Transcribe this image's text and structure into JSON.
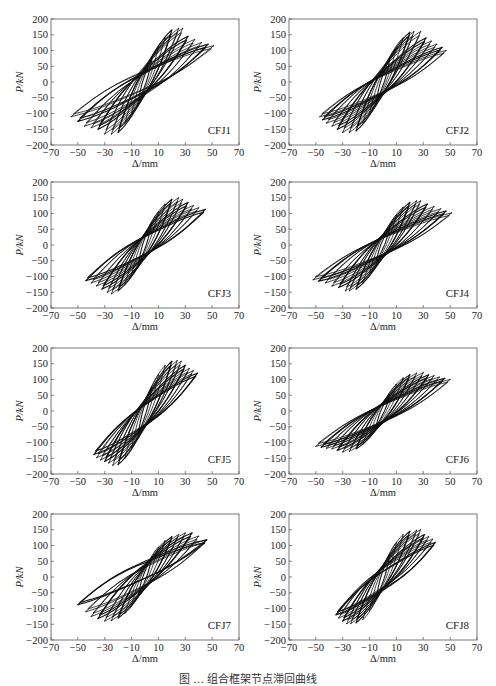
{
  "figure": {
    "caption": "图 … 组合框架节点滞回曲线"
  },
  "chart_data": [
    {
      "type": "line",
      "title": "CFJ1",
      "label": "CFJ1",
      "xlabel": "Δ/mm",
      "ylabel": "P/kN",
      "xlim": [
        -70,
        70
      ],
      "ylim": [
        -200,
        200
      ],
      "xticks": [
        -70,
        -50,
        -30,
        -10,
        10,
        30,
        50,
        70
      ],
      "yticks": [
        -200,
        -150,
        -100,
        -50,
        0,
        50,
        100,
        150,
        200
      ],
      "grid": false,
      "legend": "none",
      "label_position": "bottom-right",
      "envelope": {
        "pos": {
          "x": [
            5,
            10,
            15,
            20,
            25,
            28,
            32,
            37,
            42,
            47,
            51
          ],
          "y": [
            70,
            110,
            140,
            165,
            170,
            170,
            145,
            135,
            125,
            120,
            115
          ]
        },
        "neg": {
          "x": [
            -5,
            -10,
            -15,
            -20,
            -25,
            -30,
            -35,
            -40,
            -45,
            -50,
            -55
          ],
          "y": [
            -60,
            -100,
            -130,
            -160,
            -165,
            -165,
            -150,
            -145,
            -140,
            -125,
            -110
          ]
        }
      }
    },
    {
      "type": "line",
      "title": "CFJ2",
      "label": "CFJ2",
      "xlabel": "Δ/mm",
      "ylabel": "P/kN",
      "xlim": [
        -70,
        70
      ],
      "ylim": [
        -200,
        200
      ],
      "xticks": [
        -70,
        -50,
        -30,
        -10,
        10,
        30,
        50,
        70
      ],
      "yticks": [
        -200,
        -150,
        -100,
        -50,
        0,
        50,
        100,
        150,
        200
      ],
      "grid": false,
      "legend": "none",
      "label_position": "bottom-right",
      "envelope": {
        "pos": {
          "x": [
            5,
            10,
            15,
            20,
            23,
            28,
            32,
            36,
            40,
            44,
            47
          ],
          "y": [
            70,
            110,
            140,
            158,
            160,
            160,
            140,
            130,
            120,
            110,
            100
          ]
        },
        "neg": {
          "x": [
            -5,
            -10,
            -15,
            -20,
            -25,
            -30,
            -34,
            -38,
            -42,
            -45,
            -47
          ],
          "y": [
            -60,
            -100,
            -130,
            -155,
            -160,
            -160,
            -150,
            -140,
            -130,
            -120,
            -110
          ]
        }
      }
    },
    {
      "type": "line",
      "title": "CFJ3",
      "label": "CFJ3",
      "xlabel": "Δ/mm",
      "ylabel": "P/kN",
      "xlim": [
        -70,
        70
      ],
      "ylim": [
        -200,
        200
      ],
      "xticks": [
        -70,
        -50,
        -30,
        -10,
        10,
        30,
        50,
        70
      ],
      "yticks": [
        -200,
        -150,
        -100,
        -50,
        0,
        50,
        100,
        150,
        200
      ],
      "grid": false,
      "legend": "none",
      "label_position": "bottom-right",
      "envelope": {
        "pos": {
          "x": [
            5,
            10,
            15,
            20,
            25,
            28,
            32,
            36,
            40,
            45
          ],
          "y": [
            70,
            105,
            130,
            145,
            150,
            145,
            135,
            125,
            118,
            113
          ]
        },
        "neg": {
          "x": [
            -5,
            -10,
            -15,
            -20,
            -25,
            -28,
            -32,
            -36,
            -40,
            -44
          ],
          "y": [
            -60,
            -95,
            -125,
            -145,
            -155,
            -150,
            -140,
            -130,
            -120,
            -113
          ]
        }
      }
    },
    {
      "type": "line",
      "title": "CFJ4",
      "label": "CFJ4",
      "xlabel": "Δ/mm",
      "ylabel": "P/kN",
      "xlim": [
        -70,
        70
      ],
      "ylim": [
        -200,
        200
      ],
      "xticks": [
        -70,
        -50,
        -30,
        -10,
        10,
        30,
        50,
        70
      ],
      "yticks": [
        -200,
        -150,
        -100,
        -50,
        0,
        50,
        100,
        150,
        200
      ],
      "grid": false,
      "legend": "none",
      "label_position": "bottom-right",
      "envelope": {
        "pos": {
          "x": [
            5,
            10,
            15,
            20,
            25,
            28,
            33,
            38,
            43,
            47,
            51
          ],
          "y": [
            55,
            95,
            120,
            135,
            140,
            140,
            130,
            122,
            115,
            108,
            102
          ]
        },
        "neg": {
          "x": [
            -5,
            -10,
            -15,
            -20,
            -25,
            -28,
            -33,
            -38,
            -43,
            -48,
            -52
          ],
          "y": [
            -50,
            -90,
            -120,
            -140,
            -145,
            -145,
            -135,
            -130,
            -120,
            -115,
            -110
          ]
        }
      }
    },
    {
      "type": "line",
      "title": "CFJ5",
      "label": "CFJ5",
      "xlabel": "Δ/mm",
      "ylabel": "P/kN",
      "xlim": [
        -70,
        70
      ],
      "ylim": [
        -200,
        200
      ],
      "xticks": [
        -70,
        -50,
        -30,
        -10,
        10,
        30,
        50,
        70
      ],
      "yticks": [
        -200,
        -150,
        -100,
        -50,
        0,
        50,
        100,
        150,
        200
      ],
      "grid": false,
      "legend": "none",
      "label_position": "bottom-right",
      "envelope": {
        "pos": {
          "x": [
            5,
            10,
            15,
            20,
            24,
            27,
            30,
            33,
            36,
            39
          ],
          "y": [
            75,
            115,
            145,
            158,
            160,
            158,
            145,
            135,
            128,
            120
          ]
        },
        "neg": {
          "x": [
            -5,
            -10,
            -15,
            -20,
            -24,
            -27,
            -30,
            -33,
            -36,
            -38
          ],
          "y": [
            -70,
            -115,
            -150,
            -170,
            -172,
            -165,
            -160,
            -155,
            -148,
            -138
          ]
        }
      }
    },
    {
      "type": "line",
      "title": "CFJ6",
      "label": "CFJ6",
      "xlabel": "Δ/mm",
      "ylabel": "P/kN",
      "xlim": [
        -70,
        70
      ],
      "ylim": [
        -200,
        200
      ],
      "xticks": [
        -70,
        -50,
        -30,
        -10,
        10,
        30,
        50,
        70
      ],
      "yticks": [
        -200,
        -150,
        -100,
        -50,
        0,
        50,
        100,
        150,
        200
      ],
      "grid": false,
      "legend": "none",
      "label_position": "bottom-right",
      "envelope": {
        "pos": {
          "x": [
            5,
            10,
            15,
            20,
            25,
            30,
            34,
            38,
            42,
            46,
            50
          ],
          "y": [
            50,
            85,
            105,
            115,
            120,
            122,
            115,
            112,
            108,
            104,
            100
          ]
        },
        "neg": {
          "x": [
            -5,
            -10,
            -15,
            -20,
            -25,
            -30,
            -34,
            -38,
            -42,
            -46,
            -50
          ],
          "y": [
            -45,
            -80,
            -105,
            -120,
            -128,
            -130,
            -125,
            -120,
            -118,
            -115,
            -112
          ]
        }
      }
    },
    {
      "type": "line",
      "title": "CFJ7",
      "label": "CFJ7",
      "xlabel": "Δ/mm",
      "ylabel": "P/kN",
      "xlim": [
        -70,
        70
      ],
      "ylim": [
        -200,
        200
      ],
      "xticks": [
        -70,
        -50,
        -30,
        -10,
        10,
        30,
        50,
        70
      ],
      "yticks": [
        -200,
        -150,
        -100,
        -50,
        0,
        50,
        100,
        150,
        200
      ],
      "grid": false,
      "legend": "none",
      "label_position": "bottom-right",
      "envelope": {
        "pos": {
          "x": [
            5,
            10,
            15,
            20,
            25,
            30,
            35,
            40,
            46
          ],
          "y": [
            60,
            95,
            115,
            128,
            135,
            140,
            140,
            130,
            118
          ]
        },
        "neg": {
          "x": [
            -5,
            -10,
            -15,
            -20,
            -25,
            -30,
            -35,
            -40,
            -44,
            -50
          ],
          "y": [
            -55,
            -90,
            -115,
            -130,
            -138,
            -140,
            -132,
            -125,
            -110,
            -88
          ]
        }
      }
    },
    {
      "type": "line",
      "title": "CFJ8",
      "label": "CFJ8",
      "xlabel": "Δ/mm",
      "ylabel": "P/kN",
      "xlim": [
        -70,
        70
      ],
      "ylim": [
        -200,
        200
      ],
      "xticks": [
        -70,
        -50,
        -30,
        -10,
        10,
        30,
        50,
        70
      ],
      "yticks": [
        -200,
        -150,
        -100,
        -50,
        0,
        50,
        100,
        150,
        200
      ],
      "grid": false,
      "legend": "none",
      "label_position": "bottom-right",
      "envelope": {
        "pos": {
          "x": [
            5,
            10,
            15,
            20,
            25,
            28,
            31,
            34,
            37,
            39
          ],
          "y": [
            70,
            110,
            135,
            145,
            148,
            150,
            135,
            128,
            120,
            110
          ]
        },
        "neg": {
          "x": [
            -5,
            -10,
            -15,
            -20,
            -24,
            -27,
            -30,
            -33,
            -35
          ],
          "y": [
            -65,
            -105,
            -135,
            -145,
            -148,
            -148,
            -140,
            -130,
            -120
          ]
        }
      }
    }
  ]
}
